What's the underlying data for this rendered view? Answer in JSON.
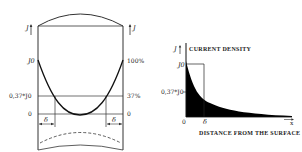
{
  "left_diagram": {
    "axis_left_symbol": "J",
    "axis_right_symbol": "J",
    "level_top_left": "J0",
    "level_mid_left": "0,37*J0",
    "level_zero_left": "0",
    "level_top_right": "100%",
    "level_mid_right": "37%",
    "level_zero_right": "0",
    "depth_left": "δ",
    "depth_right": "δ"
  },
  "right_diagram": {
    "axis_y_symbol": "J",
    "title": "CURRENT DENSITY",
    "level_top": "J0",
    "level_mid": "0,37*J0",
    "origin": "0",
    "depth_tick": "δ",
    "axis_x_symbol": "x",
    "xlabel": "DISTANCE FROM THE SURFACE"
  },
  "colors": {
    "line": "#222222",
    "fill": "#000000",
    "background": "#ffffff"
  }
}
